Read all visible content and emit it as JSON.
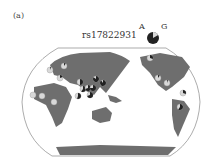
{
  "figure": {
    "panel_label": "(a)",
    "snp_id": "rs17822931",
    "legend": {
      "allele_a_label": "A",
      "allele_g_label": "G",
      "allele_a_color": "#222222",
      "allele_g_color": "#d8d8d8"
    },
    "map": {
      "projection": "Pacific-centered world map",
      "land_color": "#6e6e6e",
      "ocean_color": "#ffffff"
    },
    "pies": [
      {
        "region": "East Asia 1",
        "x": 96,
        "y": 79,
        "a_frac": 0.85
      },
      {
        "region": "East Asia 2",
        "x": 103,
        "y": 83,
        "a_frac": 0.9
      },
      {
        "region": "Central Asia",
        "x": 80,
        "y": 82,
        "a_frac": 0.5
      },
      {
        "region": "South Asia 1",
        "x": 83,
        "y": 89,
        "a_frac": 0.6
      },
      {
        "region": "South Asia 2",
        "x": 88,
        "y": 88,
        "a_frac": 0.7
      },
      {
        "region": "SE Asia 1",
        "x": 93,
        "y": 88,
        "a_frac": 0.75
      },
      {
        "region": "SE Asia 2",
        "x": 90,
        "y": 95,
        "a_frac": 0.7
      },
      {
        "region": "South Asia 3",
        "x": 78,
        "y": 96,
        "a_frac": 0.55
      },
      {
        "region": "Europe 1",
        "x": 64,
        "y": 66,
        "a_frac": 0.1
      },
      {
        "region": "Europe 2",
        "x": 50,
        "y": 70,
        "a_frac": 0.05
      },
      {
        "region": "Middle East",
        "x": 60,
        "y": 78,
        "a_frac": 0.2
      },
      {
        "region": "Africa W",
        "x": 33,
        "y": 95,
        "a_frac": 0.0
      },
      {
        "region": "Africa C",
        "x": 42,
        "y": 96,
        "a_frac": 0.0
      },
      {
        "region": "Africa E",
        "x": 54,
        "y": 102,
        "a_frac": 0.0
      },
      {
        "region": "N America 1",
        "x": 158,
        "y": 78,
        "a_frac": 0.1
      },
      {
        "region": "N America 2",
        "x": 167,
        "y": 83,
        "a_frac": 0.05
      },
      {
        "region": "Alaska",
        "x": 150,
        "y": 58,
        "a_frac": 0.3
      },
      {
        "region": "Central America",
        "x": 183,
        "y": 93,
        "a_frac": 0.3
      },
      {
        "region": "S America",
        "x": 180,
        "y": 107,
        "a_frac": 0.6
      }
    ]
  }
}
